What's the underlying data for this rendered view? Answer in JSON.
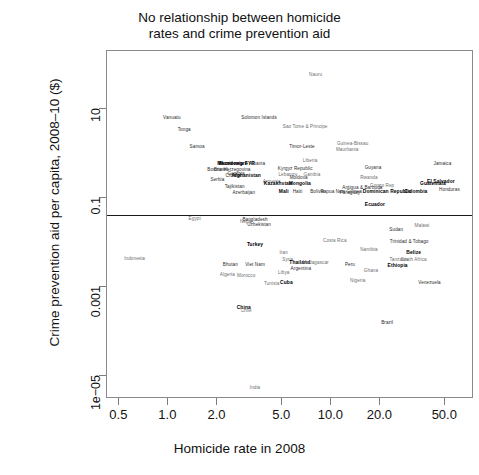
{
  "chart_data": {
    "type": "scatter",
    "title": "No relationship between homicide rates and crime prevention aid",
    "title_line1": "No relationship between homicide",
    "title_line2": "rates and crime prevention aid",
    "xlabel": "Homicide rate in 2008",
    "ylabel": "Crime prevention aid per capita, 2008–10 ($)",
    "xscale": "log",
    "yscale": "log",
    "xlim": [
      0.42,
      75
    ],
    "ylim": [
      3e-06,
      200
    ],
    "xticks": [
      0.5,
      1.0,
      2.0,
      5.0,
      10.0,
      20.0,
      50.0
    ],
    "xticklabels": [
      "0.5",
      "1.0",
      "2.0",
      "5.0",
      "10.0",
      "20.0",
      "50.0"
    ],
    "yticks": [
      10,
      0.1,
      0.001,
      1e-05
    ],
    "yticklabels": [
      "10",
      "0.1",
      "0.001",
      "1e−05"
    ],
    "grid": false,
    "legend": null,
    "marker_style": "text-labels-only",
    "annotations": [
      {
        "text": "regression line",
        "type": "hline",
        "y": 0.042,
        "note": "flat fit line spanning full x range"
      }
    ],
    "points": [
      {
        "label": "Nauru",
        "x": 8.0,
        "y": 60.0,
        "style": "g"
      },
      {
        "label": "Vanuatu",
        "x": 1.05,
        "y": 6.5,
        "style": "n"
      },
      {
        "label": "Tonga",
        "x": 1.25,
        "y": 3.6,
        "style": "n"
      },
      {
        "label": "Samoa",
        "x": 1.5,
        "y": 1.45,
        "style": "n"
      },
      {
        "label": "Solomon Islands",
        "x": 3.6,
        "y": 6.4,
        "style": "n"
      },
      {
        "label": "Sao Tome & Principe",
        "x": 6.9,
        "y": 4.2,
        "style": "g"
      },
      {
        "label": "Timor-Leste",
        "x": 6.6,
        "y": 1.5,
        "style": "n"
      },
      {
        "label": "Guinea-Bissau",
        "x": 13.5,
        "y": 1.7,
        "style": "g"
      },
      {
        "label": "Mauritania",
        "x": 12.5,
        "y": 1.25,
        "style": "g"
      },
      {
        "label": "Macedonia FYR",
        "x": 2.6,
        "y": 0.62,
        "style": "b"
      },
      {
        "label": "Montenegro",
        "x": 2.5,
        "y": 0.62,
        "style": "b"
      },
      {
        "label": "Albania",
        "x": 3.5,
        "y": 0.62,
        "style": "n"
      },
      {
        "label": "Bosnia-Herzegovina",
        "x": 2.35,
        "y": 0.44,
        "style": "n"
      },
      {
        "label": "Brunei",
        "x": 2.1,
        "y": 0.44,
        "style": "n"
      },
      {
        "label": "Croatia",
        "x": 2.5,
        "y": 0.33,
        "style": "n"
      },
      {
        "label": "Georgia",
        "x": 2.6,
        "y": 0.36,
        "style": "n"
      },
      {
        "label": "Afghanistan",
        "x": 3.0,
        "y": 0.33,
        "style": "b"
      },
      {
        "label": "Serbia",
        "x": 2.0,
        "y": 0.27,
        "style": "n"
      },
      {
        "label": "Tajikistan",
        "x": 2.55,
        "y": 0.18,
        "style": "n"
      },
      {
        "label": "Azerbaijan",
        "x": 2.9,
        "y": 0.135,
        "style": "n"
      },
      {
        "label": "Armenia",
        "x": 4.3,
        "y": 0.24,
        "style": "g"
      },
      {
        "label": "Kazakhstan",
        "x": 4.7,
        "y": 0.22,
        "style": "b"
      },
      {
        "label": "Liberia",
        "x": 7.4,
        "y": 0.72,
        "style": "g"
      },
      {
        "label": "Kyrgyz Republic",
        "x": 6.0,
        "y": 0.48,
        "style": "n"
      },
      {
        "label": "Lebanon",
        "x": 5.4,
        "y": 0.35,
        "style": "g"
      },
      {
        "label": "Gambia",
        "x": 7.6,
        "y": 0.35,
        "style": "g"
      },
      {
        "label": "Moldova",
        "x": 6.3,
        "y": 0.3,
        "style": "n"
      },
      {
        "label": "Mongolia",
        "x": 6.4,
        "y": 0.21,
        "style": "b"
      },
      {
        "label": "Guyana",
        "x": 18.0,
        "y": 0.5,
        "style": "n"
      },
      {
        "label": "Rwanda",
        "x": 17.0,
        "y": 0.29,
        "style": "g"
      },
      {
        "label": "Antigua & Barbuda",
        "x": 15.5,
        "y": 0.175,
        "style": "n"
      },
      {
        "label": "Dominican Republic",
        "x": 22.0,
        "y": 0.145,
        "style": "b"
      },
      {
        "label": "Congo Rep",
        "x": 20.5,
        "y": 0.19,
        "style": "g"
      },
      {
        "label": "Bolivia",
        "x": 8.2,
        "y": 0.145,
        "style": "n"
      },
      {
        "label": "Papua New Guinea",
        "x": 11.5,
        "y": 0.145,
        "style": "n"
      },
      {
        "label": "Paraguay",
        "x": 13.0,
        "y": 0.135,
        "style": "n"
      },
      {
        "label": "Haiti",
        "x": 6.2,
        "y": 0.145,
        "style": "n"
      },
      {
        "label": "Mali",
        "x": 5.1,
        "y": 0.145,
        "style": "b"
      },
      {
        "label": "Jamaica",
        "x": 48.0,
        "y": 0.62,
        "style": "n"
      },
      {
        "label": "El Salvador",
        "x": 47.0,
        "y": 0.24,
        "style": "b"
      },
      {
        "label": "Guatemala",
        "x": 42.0,
        "y": 0.215,
        "style": "b"
      },
      {
        "label": "Honduras",
        "x": 53.0,
        "y": 0.16,
        "style": "n"
      },
      {
        "label": "Colombia",
        "x": 33.0,
        "y": 0.145,
        "style": "b"
      },
      {
        "label": "Ecuador",
        "x": 18.5,
        "y": 0.072,
        "style": "b"
      },
      {
        "label": "Egypt",
        "x": 1.45,
        "y": 0.035,
        "style": "g"
      },
      {
        "label": "Bangladesh",
        "x": 3.4,
        "y": 0.034,
        "style": "n"
      },
      {
        "label": "Uzbekistan",
        "x": 3.6,
        "y": 0.026,
        "style": "n"
      },
      {
        "label": "Nepal",
        "x": 3.0,
        "y": 0.03,
        "style": "g"
      },
      {
        "label": "Sudan",
        "x": 25.0,
        "y": 0.02,
        "style": "n"
      },
      {
        "label": "Malawi",
        "x": 36.0,
        "y": 0.024,
        "style": "g"
      },
      {
        "label": "Indonesia",
        "x": 0.62,
        "y": 0.0045,
        "style": "g"
      },
      {
        "label": "Bhutan",
        "x": 2.4,
        "y": 0.0032,
        "style": "n"
      },
      {
        "label": "Viet Nam",
        "x": 3.4,
        "y": 0.0033,
        "style": "n"
      },
      {
        "label": "Algeria",
        "x": 2.3,
        "y": 0.0019,
        "style": "g"
      },
      {
        "label": "Morocco",
        "x": 3.0,
        "y": 0.0018,
        "style": "g"
      },
      {
        "label": "Syria",
        "x": 5.4,
        "y": 0.0042,
        "style": "g"
      },
      {
        "label": "Iran",
        "x": 5.1,
        "y": 0.006,
        "style": "g"
      },
      {
        "label": "Libya",
        "x": 5.1,
        "y": 0.0022,
        "style": "g"
      },
      {
        "label": "Tunisia",
        "x": 4.3,
        "y": 0.0012,
        "style": "g"
      },
      {
        "label": "China",
        "x": 2.9,
        "y": 0.00035,
        "style": "b"
      },
      {
        "label": "Chile",
        "x": 3.0,
        "y": 0.0003,
        "style": "g"
      },
      {
        "label": "Turkey",
        "x": 3.4,
        "y": 0.009,
        "style": "b"
      },
      {
        "label": "Thailand",
        "x": 6.4,
        "y": 0.0036,
        "style": "b"
      },
      {
        "label": "Argentina",
        "x": 6.5,
        "y": 0.0026,
        "style": "n"
      },
      {
        "label": "Cuba",
        "x": 5.3,
        "y": 0.0013,
        "style": "b"
      },
      {
        "label": "Madagascar",
        "x": 8.0,
        "y": 0.0037,
        "style": "g"
      },
      {
        "label": "Peru",
        "x": 13.0,
        "y": 0.0032,
        "style": "n"
      },
      {
        "label": "Ghana",
        "x": 17.5,
        "y": 0.0024,
        "style": "g"
      },
      {
        "label": "Nigeria",
        "x": 14.5,
        "y": 0.0014,
        "style": "g"
      },
      {
        "label": "Costa Rica",
        "x": 10.5,
        "y": 0.0115,
        "style": "g"
      },
      {
        "label": "Namibia",
        "x": 17.0,
        "y": 0.0072,
        "style": "g"
      },
      {
        "label": "Trinidad & Tobago",
        "x": 30.0,
        "y": 0.0105,
        "style": "n"
      },
      {
        "label": "Belize",
        "x": 32.0,
        "y": 0.006,
        "style": "b"
      },
      {
        "label": "Tanzania",
        "x": 26.0,
        "y": 0.0042,
        "style": "g"
      },
      {
        "label": "South Africa",
        "x": 32.0,
        "y": 0.0042,
        "style": "g"
      },
      {
        "label": "Ethiopia",
        "x": 25.5,
        "y": 0.0031,
        "style": "b"
      },
      {
        "label": "Venezuela",
        "x": 40.0,
        "y": 0.0013,
        "style": "n"
      },
      {
        "label": "Brazil",
        "x": 22.0,
        "y": 0.00016,
        "style": "n"
      },
      {
        "label": "India",
        "x": 3.4,
        "y": 5.5e-06,
        "style": "g"
      }
    ]
  }
}
